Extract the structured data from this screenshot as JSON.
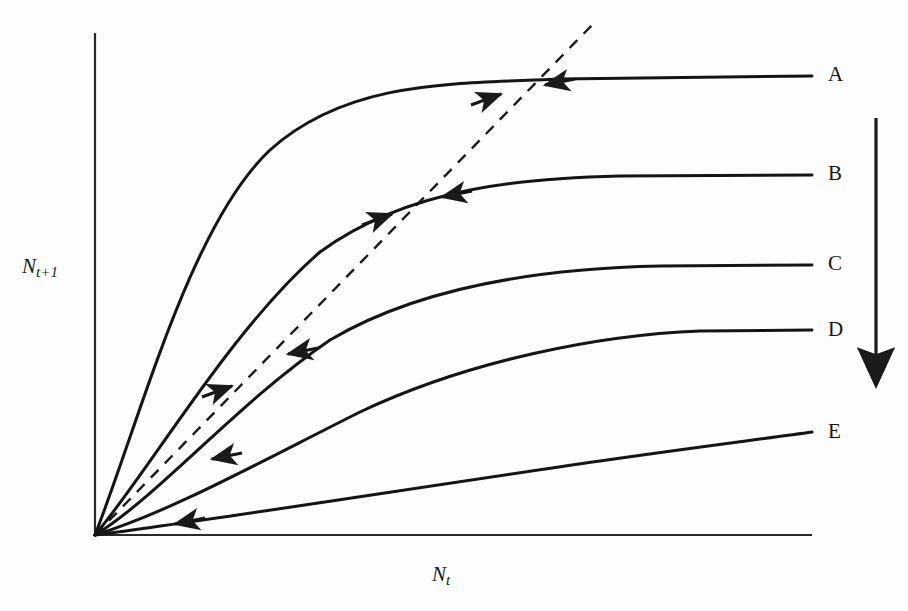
{
  "figure": {
    "kind": "recruitment-curve-diagram",
    "background_color": "#fdfdfd",
    "ink_color": "#1a1a1a"
  },
  "axes": {
    "y_label_main": "N",
    "y_label_sub": "t+1",
    "x_label_main": "N",
    "x_label_sub": "t",
    "origin": [
      95,
      535
    ],
    "y_axis_top": 33,
    "x_axis_right": 812
  },
  "curve_labels": [
    {
      "text": "A",
      "x": 828,
      "y": 62
    },
    {
      "text": "B",
      "x": 828,
      "y": 161
    },
    {
      "text": "C",
      "x": 828,
      "y": 251
    },
    {
      "text": "D",
      "x": 828,
      "y": 317
    },
    {
      "text": "E",
      "x": 828,
      "y": 419
    }
  ],
  "trend_arrow": {
    "name": "decreasing-recruitment-arrow",
    "x": 876,
    "y_start": 118,
    "y_end": 382
  },
  "chart_data": {
    "type": "line",
    "title": "",
    "xlabel": "N_t",
    "ylabel": "N_t+1",
    "grid": false,
    "legend": "right-inline-labels",
    "xlim": [
      0,
      812
    ],
    "ylim": [
      0,
      535
    ],
    "reference_line": {
      "name": "replacement-line",
      "style": "dashed",
      "from": [
        95,
        535
      ],
      "to": [
        595,
        22
      ]
    },
    "series": [
      {
        "name": "A",
        "label": "A",
        "asymptote_y": 76,
        "path": "M 95 535 C 140 420, 190 225, 270 150 C 350 78, 460 84, 560 79 L 812 76",
        "equilibrium": {
          "x": 520,
          "y": 88
        },
        "arrows": [
          {
            "x": 501,
            "y": 94,
            "dir": "right"
          },
          {
            "x": 545,
            "y": 85,
            "dir": "left"
          }
        ]
      },
      {
        "name": "B",
        "label": "B",
        "asymptote_y": 175,
        "path": "M 95 535 C 150 470, 230 330, 320 252 C 410 186, 530 178, 620 176 L 812 175",
        "equilibrium": {
          "x": 415,
          "y": 205
        },
        "arrows": [
          {
            "x": 392,
            "y": 214,
            "dir": "right"
          },
          {
            "x": 442,
            "y": 197,
            "dir": "left"
          }
        ]
      },
      {
        "name": "C",
        "label": "C",
        "asymptote_y": 265,
        "path": "M 95 535 C 160 495, 235 405, 330 340 C 430 281, 560 268, 660 266 L 812 265",
        "equilibrium": {
          "x": 258,
          "y": 370
        },
        "arrows": [
          {
            "x": 232,
            "y": 386,
            "dir": "right"
          },
          {
            "x": 288,
            "y": 354,
            "dir": "left"
          }
        ]
      },
      {
        "name": "D",
        "label": "D",
        "asymptote_y": 330,
        "path": "M 95 535 C 170 512, 260 462, 360 412 C 470 360, 600 335, 700 331 L 812 330",
        "equilibrium": {
          "x": 178,
          "y": 487
        },
        "arrows": [
          {
            "x": 212,
            "y": 459,
            "dir": "left"
          }
        ]
      },
      {
        "name": "E",
        "label": "E",
        "asymptote_y": 432,
        "path": "M 95 535 C 220 519, 420 487, 600 461 C 690 448, 770 438, 812 432",
        "equilibrium": {
          "x": 95,
          "y": 535
        },
        "arrows": [
          {
            "x": 175,
            "y": 524,
            "dir": "left"
          }
        ]
      }
    ]
  }
}
